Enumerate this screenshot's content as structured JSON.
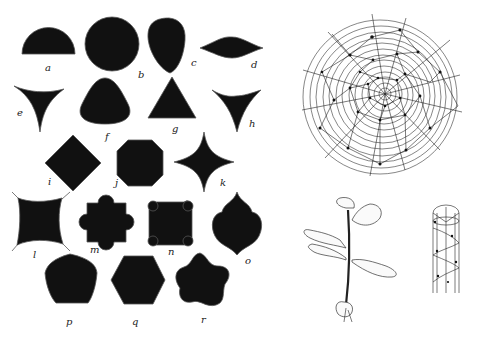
{
  "figure": {
    "shape_labels": {
      "a": "a",
      "b": "b",
      "c": "c",
      "d": "d",
      "e": "e",
      "f": "f",
      "g": "g",
      "h": "h",
      "i": "i",
      "j": "j",
      "k": "k",
      "l": "l",
      "m": "m",
      "n": "n",
      "o": "o",
      "p": "p",
      "q": "q",
      "r": "r"
    },
    "shapes": [
      {
        "id": "a",
        "name": "semicircle"
      },
      {
        "id": "b",
        "name": "circle"
      },
      {
        "id": "c",
        "name": "ovate-teardrop"
      },
      {
        "id": "d",
        "name": "lens-lenticular"
      },
      {
        "id": "e",
        "name": "concave-triangle"
      },
      {
        "id": "f",
        "name": "rounded-triangle"
      },
      {
        "id": "g",
        "name": "triangle"
      },
      {
        "id": "h",
        "name": "concave-triangle-inverted"
      },
      {
        "id": "i",
        "name": "square-rhombus"
      },
      {
        "id": "j",
        "name": "octagon"
      },
      {
        "id": "k",
        "name": "concave-star-4"
      },
      {
        "id": "l",
        "name": "square-with-corner-wings"
      },
      {
        "id": "m",
        "name": "cross-with-lobes"
      },
      {
        "id": "n",
        "name": "square-with-rounded-corners"
      },
      {
        "id": "o",
        "name": "ogee-quatrefoil"
      },
      {
        "id": "p",
        "name": "pentagon"
      },
      {
        "id": "q",
        "name": "hexagon"
      },
      {
        "id": "r",
        "name": "five-lobed-star"
      }
    ],
    "diagrams": [
      {
        "id": "spiral-diagram",
        "name": "concentric phyllotaxis circle diagram"
      },
      {
        "id": "oak-seedling",
        "name": "oak seedling with leaves"
      },
      {
        "id": "cylinder-diagram",
        "name": "helical leaf arrangement on cylinder"
      }
    ]
  }
}
